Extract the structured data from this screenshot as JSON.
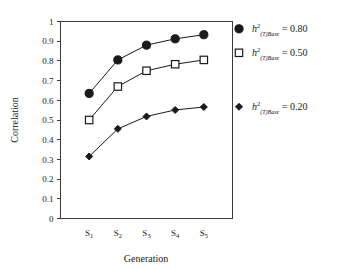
{
  "chart_data": {
    "type": "line",
    "title": "",
    "xlabel": "Generation",
    "ylabel": "Correlation",
    "categories": [
      "S1",
      "S2",
      "S3",
      "S4",
      "S5"
    ],
    "category_labels": [
      {
        "base": "S",
        "sub": "1"
      },
      {
        "base": "S",
        "sub": "2"
      },
      {
        "base": "S",
        "sub": "3"
      },
      {
        "base": "S",
        "sub": "4"
      },
      {
        "base": "S",
        "sub": "5"
      }
    ],
    "ylim": [
      0,
      1
    ],
    "yticks": [
      "0",
      "0.1",
      "0.2",
      "0.3",
      "0.4",
      "0.5",
      "0.6",
      "0.7",
      "0.8",
      "0.9",
      "1"
    ],
    "ytick_values": [
      0,
      0.1,
      0.2,
      0.3,
      0.4,
      0.5,
      0.6,
      0.7,
      0.8,
      0.9,
      1
    ],
    "grid": false,
    "legend_position": "right",
    "series": [
      {
        "name": "h2_(T)Base = 0.80",
        "marker": "filled-circle",
        "values": [
          0.635,
          0.805,
          0.88,
          0.912,
          0.933
        ],
        "legend": {
          "symbol": "h",
          "superscript": "2",
          "subscript": "(T)Base",
          "equals": "=",
          "value": "0.80"
        }
      },
      {
        "name": "h2_(T)Base = 0.50",
        "marker": "open-square",
        "values": [
          0.5,
          0.67,
          0.75,
          0.783,
          0.805
        ],
        "legend": {
          "symbol": "h",
          "superscript": "2",
          "subscript": "(T)Base",
          "equals": "=",
          "value": "0.50"
        }
      },
      {
        "name": "h2_(T)Base = 0.20",
        "marker": "filled-diamond",
        "values": [
          0.315,
          0.455,
          0.518,
          0.551,
          0.566
        ],
        "legend": {
          "symbol": "h",
          "superscript": "2",
          "subscript": "(T)Base",
          "equals": "=",
          "value": "0.20"
        }
      }
    ]
  },
  "colors": {
    "axis": "#3a3a3a",
    "line": "#1a1a1a",
    "marker_fill": "#1a1a1a",
    "marker_open_fill": "#ffffff",
    "background": "#ffffff"
  }
}
